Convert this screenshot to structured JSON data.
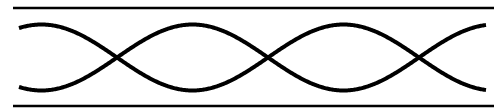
{
  "diagram": {
    "stroke_color": "#000000",
    "background_color": "#ffffff",
    "boundaries": [
      {
        "name": "top-boundary"
      },
      {
        "name": "bottom-boundary"
      }
    ],
    "waves": [
      {
        "name": "wave-envelope-upper",
        "phase": "starts-high"
      },
      {
        "name": "wave-envelope-lower",
        "phase": "starts-low"
      }
    ],
    "node_count": 3,
    "half_wavelengths_shown": 3
  }
}
